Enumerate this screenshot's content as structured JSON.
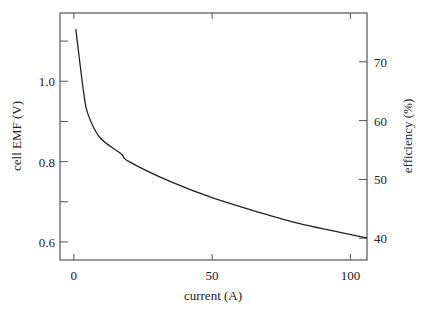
{
  "chart_data": {
    "type": "line",
    "title": "",
    "xlabel": "current (A)",
    "ylabel": "cell EMF (V)",
    "ylabel_right": "efficiency  (%)",
    "xlim": [
      -5,
      106
    ],
    "ylim": [
      0.555,
      1.17
    ],
    "ylim_right": [
      36.3,
      78.3
    ],
    "x_ticks": [
      0,
      50,
      100
    ],
    "x_tick_labels": [
      "0",
      "50",
      "100"
    ],
    "y_ticks": [
      0.6,
      0.8,
      1.0
    ],
    "y_tick_labels": [
      "0.6",
      "0.8",
      "1.0"
    ],
    "y_minor_ticks": [
      0.7,
      0.9,
      1.1
    ],
    "y_right_ticks": [
      40,
      50,
      60,
      70
    ],
    "y_right_tick_labels": [
      "40",
      "50",
      "60",
      "70"
    ],
    "grid": false,
    "legend": null,
    "series": [
      {
        "name": "cell EMF",
        "x": [
          0.7,
          2.2,
          3.6,
          5,
          9.4,
          17,
          20,
          35,
          50,
          64,
          82,
          106
        ],
        "values": [
          1.13,
          1.045,
          0.97,
          0.92,
          0.86,
          0.82,
          0.8,
          0.75,
          0.71,
          0.68,
          0.645,
          0.61
        ]
      }
    ]
  }
}
